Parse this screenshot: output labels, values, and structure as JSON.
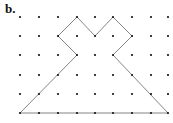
{
  "figure": {
    "label": "b.",
    "grid": {
      "columns": 9,
      "rows": 6,
      "x_positions": [
        20,
        39,
        58,
        77,
        95,
        113,
        132,
        151,
        168
      ],
      "y_positions": [
        17,
        36,
        55,
        75,
        94,
        113
      ],
      "dot_color": "#111111"
    },
    "polygon": {
      "vertices_grid": [
        [
          0,
          5
        ],
        [
          3,
          2
        ],
        [
          2,
          1
        ],
        [
          3,
          0
        ],
        [
          4,
          1
        ],
        [
          5,
          0
        ],
        [
          6,
          1
        ],
        [
          5,
          2
        ],
        [
          8,
          5
        ]
      ],
      "stroke_color": "#777777"
    }
  }
}
